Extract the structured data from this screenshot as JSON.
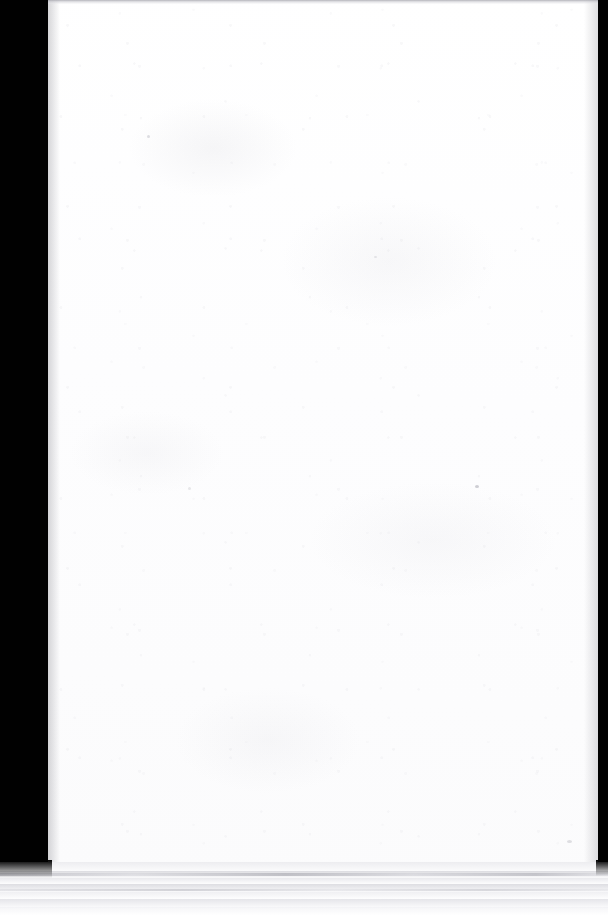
{
  "document": {
    "kind": "scanned-page",
    "page_content": "",
    "page_note": "blank page",
    "visible_text": []
  },
  "scan": {
    "width_px": 608,
    "height_px": 915,
    "sheet": {
      "left_px": 48,
      "top_px": 0,
      "width_px": 550,
      "height_px": 871,
      "color": "#fefeff"
    },
    "backing": {
      "name": "scanner-backing",
      "color": "#010101",
      "left_margin_px": 48,
      "right_margin_px": 10
    },
    "top_edge_rule": {
      "color": "#a8a8af",
      "height_px": 4
    },
    "stack_edge": {
      "name": "page-stack-edge",
      "top_px": 862,
      "height_px": 53,
      "base_color": "#ffffff",
      "band_color": "#d7d7dc",
      "crease_color": "#a2a2aa"
    },
    "specks": [
      {
        "name": "dust-speck-1",
        "x_px": 475,
        "y_px": 485
      },
      {
        "name": "dust-speck-2",
        "x_px": 567,
        "y_px": 840
      },
      {
        "name": "dust-speck-3",
        "x_px": 147,
        "y_px": 135
      },
      {
        "name": "dust-speck-4",
        "x_px": 374,
        "y_px": 256
      },
      {
        "name": "dust-speck-5",
        "x_px": 188,
        "y_px": 487
      }
    ]
  },
  "caption": {
    "alt_text": "Scanned blank white page on a black scanner background, with the edge of a paper stack visible along the bottom."
  }
}
